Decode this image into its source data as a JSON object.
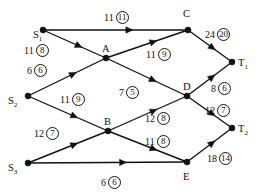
{
  "diagram": {
    "type": "network-flow-graph",
    "title": "",
    "nodes": [
      {
        "id": "S1",
        "label": "S",
        "subscript": "1",
        "x": 33,
        "y": 30,
        "dot_x": 43,
        "dot_y": 30
      },
      {
        "id": "S2",
        "label": "S",
        "subscript": "2",
        "x": 8,
        "y": 96,
        "dot_x": 28,
        "dot_y": 96
      },
      {
        "id": "S3",
        "label": "S",
        "subscript": "3",
        "x": 8,
        "y": 163,
        "dot_x": 28,
        "dot_y": 163
      },
      {
        "id": "A",
        "label": "A",
        "subscript": "",
        "x": 102,
        "y": 44,
        "dot_x": 106,
        "dot_y": 58
      },
      {
        "id": "B",
        "label": "B",
        "subscript": "",
        "x": 104,
        "y": 117,
        "dot_x": 108,
        "dot_y": 131
      },
      {
        "id": "C",
        "label": "C",
        "subscript": "",
        "x": 183,
        "y": 9,
        "dot_x": 188,
        "dot_y": 30
      },
      {
        "id": "D",
        "label": "D",
        "subscript": "",
        "x": 183,
        "y": 82,
        "dot_x": 187,
        "dot_y": 96
      },
      {
        "id": "E",
        "label": "E",
        "subscript": "",
        "x": 183,
        "y": 172,
        "dot_x": 187,
        "dot_y": 162
      },
      {
        "id": "T1",
        "label": "T",
        "subscript": "1",
        "x": 238,
        "y": 58,
        "dot_x": 232,
        "dot_y": 62
      },
      {
        "id": "T2",
        "label": "T",
        "subscript": "2",
        "x": 238,
        "y": 124,
        "dot_x": 232,
        "dot_y": 128
      }
    ],
    "edges": [
      {
        "id": "S1-C",
        "from": "S1",
        "to": "C",
        "capacity": "11",
        "flow": "11",
        "label_x": 104,
        "label_y": 11
      },
      {
        "id": "S1-A",
        "from": "S1",
        "to": "A",
        "capacity": "11",
        "flow": "8",
        "label_x": 24,
        "label_y": 44
      },
      {
        "id": "S2-A",
        "from": "S2",
        "to": "A",
        "capacity": "6",
        "flow": "6",
        "label_x": 27,
        "label_y": 64
      },
      {
        "id": "S2-B",
        "from": "S2",
        "to": "B",
        "capacity": "11",
        "flow": "9",
        "label_x": 60,
        "label_y": 93
      },
      {
        "id": "S3-B",
        "from": "S3",
        "to": "B",
        "capacity": "12",
        "flow": "7",
        "label_x": 34,
        "label_y": 127
      },
      {
        "id": "S3-E",
        "from": "S3",
        "to": "E",
        "capacity": "6",
        "flow": "6",
        "label_x": 101,
        "label_y": 176
      },
      {
        "id": "A-C",
        "from": "A",
        "to": "C",
        "capacity": "11",
        "flow": "9",
        "label_x": 146,
        "label_y": 48
      },
      {
        "id": "A-D",
        "from": "A",
        "to": "D",
        "capacity": "7",
        "flow": "5",
        "label_x": 119,
        "label_y": 86
      },
      {
        "id": "B-D",
        "from": "B",
        "to": "D",
        "capacity": "12",
        "flow": "8",
        "label_x": 145,
        "label_y": 112
      },
      {
        "id": "B-E",
        "from": "B",
        "to": "E",
        "capacity": "11",
        "flow": "8",
        "label_x": 145,
        "label_y": 135
      },
      {
        "id": "C-T1",
        "from": "C",
        "to": "T1",
        "capacity": "24",
        "flow": "20",
        "label_x": 205,
        "label_y": 28
      },
      {
        "id": "D-T1",
        "from": "D",
        "to": "T1",
        "capacity": "8",
        "flow": "6",
        "label_x": 211,
        "label_y": 82
      },
      {
        "id": "D-T2",
        "from": "D",
        "to": "T2",
        "capacity": "12",
        "flow": "7",
        "label_x": 205,
        "label_y": 104
      },
      {
        "id": "E-T2",
        "from": "E",
        "to": "T2",
        "capacity": "18",
        "flow": "14",
        "label_x": 207,
        "label_y": 152
      }
    ],
    "colors": {
      "stroke": "#111111",
      "background": "#ffffff"
    }
  }
}
